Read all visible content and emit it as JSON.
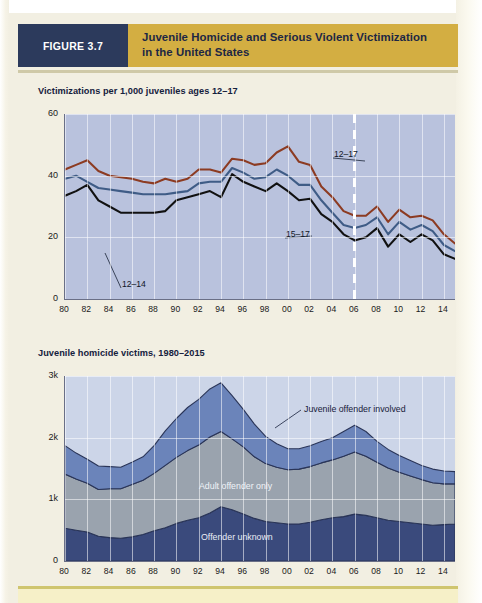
{
  "header": {
    "figure_tag": "FIGURE 3.7",
    "title_line1": "Juvenile Homicide and Serious Violent Victimization",
    "title_line2": "in the United States",
    "tag_bg": "#2c3a5c",
    "band_bg": "#d3ae42"
  },
  "chart_data": [
    {
      "id": "chart1",
      "type": "line",
      "title": "Victimizations per 1,000 juveniles ages 12–17",
      "xlabel": "",
      "ylabel": "",
      "ylim": [
        0,
        60
      ],
      "yticks": [
        "0",
        "20",
        "40",
        "60"
      ],
      "ytick_values": [
        0,
        20,
        40,
        60
      ],
      "x": [
        1980,
        1981,
        1982,
        1983,
        1984,
        1985,
        1986,
        1987,
        1988,
        1989,
        1990,
        1991,
        1992,
        1993,
        1994,
        1995,
        1996,
        1997,
        1998,
        1999,
        2000,
        2001,
        2002,
        2003,
        2004,
        2005,
        2006,
        2007,
        2008,
        2009,
        2010,
        2011,
        2012,
        2013,
        2014,
        2015
      ],
      "xticks": [
        "80",
        "82",
        "84",
        "86",
        "88",
        "90",
        "92",
        "94",
        "96",
        "98",
        "00",
        "02",
        "04",
        "06",
        "08",
        "10",
        "12",
        "14"
      ],
      "xtick_values": [
        1980,
        1982,
        1984,
        1986,
        1988,
        1990,
        1992,
        1994,
        1996,
        1998,
        2000,
        2002,
        2004,
        2006,
        2008,
        2010,
        2012,
        2014
      ],
      "grid": true,
      "legend_position": "inline-annotations",
      "plot_bg": "#b9c2dd",
      "annotation_dashed_line_year": 2006,
      "series": [
        {
          "name": "12–17",
          "color": "#8c3b22",
          "label_x": 2003,
          "values": [
            42,
            43.5,
            45,
            41.5,
            40,
            39.5,
            39,
            38,
            37.5,
            39,
            38,
            39,
            42,
            42,
            41,
            45.5,
            45,
            43.5,
            44,
            47.5,
            49.5,
            44.5,
            43.5,
            36.5,
            33,
            28.5,
            27,
            27,
            30,
            25,
            29,
            26.5,
            27,
            25.5,
            21,
            18,
            0
          ]
        },
        {
          "name": "15–17",
          "color": "#3f5c86",
          "label_x": 2000,
          "values": [
            39,
            40,
            38,
            36,
            35.5,
            35,
            34.5,
            34,
            34,
            34,
            34.5,
            35,
            37.5,
            38,
            38,
            42.5,
            41,
            39,
            39.5,
            42,
            40,
            37,
            37,
            32,
            28,
            24,
            23,
            24,
            26.5,
            21,
            25,
            22.5,
            24,
            22,
            17.5,
            15.5
          ]
        },
        {
          "name": "12–14",
          "color": "#111111",
          "label_x": 1985,
          "values": [
            33.5,
            35,
            37,
            32,
            30,
            28,
            28,
            28,
            28,
            28.5,
            32,
            33,
            34,
            35,
            33,
            40.5,
            38,
            36.5,
            35,
            37.5,
            35,
            32,
            32.5,
            27.5,
            25,
            21,
            19,
            20,
            23,
            17,
            21,
            18.5,
            21,
            19,
            14.5,
            13
          ]
        }
      ]
    },
    {
      "id": "chart2",
      "type": "area",
      "stacked": true,
      "title": "Juvenile homicide victims, 1980–2015",
      "xlabel": "",
      "ylabel": "",
      "ylim": [
        0,
        3000
      ],
      "yticks": [
        "0",
        "1k",
        "2k",
        "3k"
      ],
      "ytick_values": [
        0,
        1000,
        2000,
        3000
      ],
      "x": [
        1980,
        1981,
        1982,
        1983,
        1984,
        1985,
        1986,
        1987,
        1988,
        1989,
        1990,
        1991,
        1992,
        1993,
        1994,
        1995,
        1996,
        1997,
        1998,
        1999,
        2000,
        2001,
        2002,
        2003,
        2004,
        2005,
        2006,
        2007,
        2008,
        2009,
        2010,
        2011,
        2012,
        2013,
        2014,
        2015
      ],
      "xticks": [
        "80",
        "82",
        "84",
        "86",
        "88",
        "90",
        "92",
        "94",
        "96",
        "98",
        "00",
        "02",
        "04",
        "06",
        "08",
        "10",
        "12",
        "14"
      ],
      "xtick_values": [
        1980,
        1982,
        1984,
        1986,
        1988,
        1990,
        1992,
        1994,
        1996,
        1998,
        2000,
        2002,
        2004,
        2006,
        2008,
        2010,
        2012,
        2014
      ],
      "grid": true,
      "legend_position": "inline-area-labels",
      "plot_bg": "#ccd5e8",
      "series": [
        {
          "name": "Offender unknown",
          "color": "#3a4a7c",
          "label": "Offender unknown",
          "values": [
            530,
            500,
            470,
            400,
            380,
            370,
            390,
            430,
            490,
            540,
            610,
            660,
            700,
            780,
            880,
            830,
            760,
            690,
            640,
            620,
            600,
            600,
            630,
            670,
            700,
            720,
            760,
            740,
            700,
            660,
            640,
            620,
            600,
            580,
            590,
            600
          ]
        },
        {
          "name": "Adult offender only",
          "color": "#9aa3ae",
          "label": "Adult offender only",
          "values": [
            880,
            830,
            790,
            760,
            790,
            800,
            850,
            880,
            930,
            1010,
            1070,
            1130,
            1180,
            1230,
            1220,
            1150,
            1090,
            1000,
            940,
            900,
            880,
            890,
            900,
            920,
            940,
            980,
            1010,
            960,
            900,
            850,
            800,
            760,
            720,
            690,
            660,
            650
          ]
        },
        {
          "name": "Juvenile offender involved",
          "color": "#6b84ba",
          "label": "Juvenile offender involved",
          "values": [
            460,
            420,
            390,
            380,
            360,
            350,
            360,
            380,
            450,
            560,
            630,
            700,
            740,
            780,
            790,
            700,
            610,
            530,
            440,
            380,
            340,
            330,
            340,
            350,
            360,
            400,
            430,
            400,
            340,
            300,
            270,
            250,
            230,
            220,
            210,
            200
          ]
        }
      ]
    }
  ],
  "footer": {
    "rule_color": "#cfc56f",
    "band_color": "#f6f0c8"
  }
}
